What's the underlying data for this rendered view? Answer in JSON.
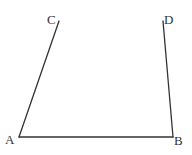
{
  "diagram": {
    "type": "geometry-figure",
    "stroke_color": "#333333",
    "points": {
      "A": {
        "label": "A",
        "x": 19,
        "y": 137
      },
      "B": {
        "label": "B",
        "x": 173,
        "y": 137
      },
      "C": {
        "label": "C",
        "x": 59,
        "y": 21
      },
      "D": {
        "label": "D",
        "x": 163,
        "y": 21
      }
    },
    "segments": [
      {
        "from": "A",
        "to": "B"
      },
      {
        "from": "A",
        "to": "C"
      },
      {
        "from": "B",
        "to": "D"
      }
    ]
  }
}
